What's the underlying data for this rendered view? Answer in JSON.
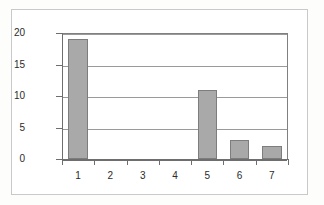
{
  "chart_data": {
    "type": "bar",
    "title": "",
    "xlabel": "",
    "ylabel": "",
    "categories": [
      "1",
      "2",
      "3",
      "4",
      "5",
      "6",
      "7"
    ],
    "values": [
      19,
      0,
      0,
      0,
      11,
      3,
      2
    ],
    "ylim": [
      0,
      20
    ],
    "ytick_labels": [
      "0",
      "5",
      "10",
      "15",
      "20"
    ],
    "ytick_values": [
      0,
      5,
      10,
      15,
      20
    ],
    "grid": true,
    "legend": false,
    "legend_position": "none",
    "series": [
      {
        "name": "Series 1",
        "values": [
          19,
          0,
          0,
          0,
          11,
          3,
          2
        ]
      }
    ],
    "colors": {
      "bar_fill": "#a9a9a9",
      "bar_stroke": "#7d7d7d",
      "gridline": "#9a9a9a",
      "axis": "#6e6e6e",
      "plot_background": "#ffffff",
      "frame_border": "#c9c9c9",
      "page_background": "#fdfdfc",
      "tick_label": "#2b2b2b"
    }
  }
}
